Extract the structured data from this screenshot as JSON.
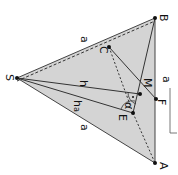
{
  "diagram": {
    "type": "pyramid-face-geometry",
    "orientation": "rotated 90deg clockwise",
    "colors": {
      "fill": "#d4d4d4",
      "stroke": "#333333",
      "background": "#ffffff"
    },
    "points": {
      "S": {
        "label": "S",
        "x": 17,
        "y": 78
      },
      "B": {
        "label": "B",
        "x": 155,
        "y": 18
      },
      "A": {
        "label": "A",
        "x": 155,
        "y": 163
      },
      "C": {
        "label": "C",
        "x": 109,
        "y": 47
      },
      "M": {
        "label": "M",
        "x": 140,
        "y": 94
      },
      "F": {
        "label": "F",
        "x": 156,
        "y": 99
      },
      "E": {
        "label": "E",
        "x": 133,
        "y": 113
      }
    },
    "edge_labels": {
      "SB": "a",
      "SA": "a",
      "BA": "a",
      "SM": "h",
      "SE": "h",
      "SE_sub": "a",
      "angle": "α"
    },
    "scale_bar": {
      "label": "a"
    }
  }
}
